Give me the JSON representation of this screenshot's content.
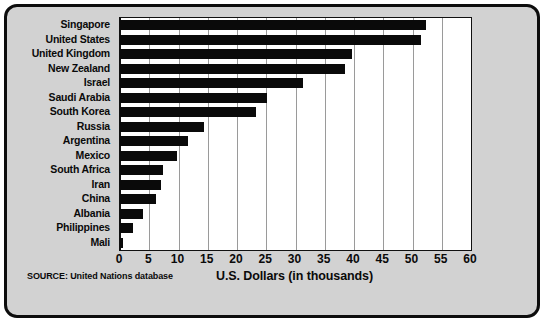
{
  "chart_data": {
    "type": "bar",
    "orientation": "horizontal",
    "title": "",
    "xlabel": "U.S. Dollars (in thousands)",
    "ylabel": "",
    "xlim": [
      0,
      60
    ],
    "xticks": [
      0,
      5,
      10,
      15,
      20,
      25,
      30,
      35,
      40,
      45,
      50,
      55,
      60
    ],
    "grid": "vertical",
    "legend": null,
    "categories": [
      "Singapore",
      "United States",
      "United Kingdom",
      "New Zealand",
      "Israel",
      "Saudi Arabia",
      "South Korea",
      "Russia",
      "Argentina",
      "Mexico",
      "South Africa",
      "Iran",
      "China",
      "Albania",
      "Philippines",
      "Mali"
    ],
    "values": [
      52.3,
      51.5,
      39.6,
      38.5,
      31.2,
      25.2,
      23.3,
      14.3,
      11.7,
      9.8,
      7.3,
      7.0,
      6.2,
      3.9,
      2.2,
      0.5
    ],
    "series": [
      {
        "name": "GDP per capita",
        "values": [
          52.3,
          51.5,
          39.6,
          38.5,
          31.2,
          25.2,
          23.3,
          14.3,
          11.7,
          9.8,
          7.3,
          7.0,
          6.2,
          3.9,
          2.2,
          0.5
        ]
      }
    ],
    "bar_color": "#0a0a0a",
    "plot_background": "#ffffff",
    "figure_background": "#d2d2d2",
    "gridline_color": "#9a9a9a"
  },
  "annotations": {
    "source": "SOURCE: United Nations database"
  }
}
